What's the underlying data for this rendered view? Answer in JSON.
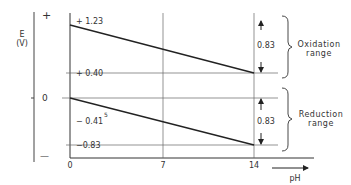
{
  "diagram": {
    "y_axis": {
      "label": "E",
      "unit": "(V)",
      "plus_sign": "+",
      "zero": "0",
      "minus_sign": "—"
    },
    "x_axis": {
      "label": "pH",
      "ticks": [
        "0",
        "7",
        "14"
      ]
    },
    "levels": {
      "top": "+ 1.23",
      "upper_mid": "+ 0.40",
      "zero": "0",
      "lower_mid": "− 0.41",
      "lower_mid_superscript": "5",
      "bottom": "−0.83"
    },
    "spans": {
      "oxidation_value": "0.83",
      "reduction_value": "0.83"
    },
    "ranges": {
      "oxidation_line1": "Oxidation",
      "oxidation_line2": "range",
      "reduction_line1": "Reduction",
      "reduction_line2": "range"
    },
    "colors": {
      "line": "#222222",
      "grid": "#555555"
    }
  }
}
